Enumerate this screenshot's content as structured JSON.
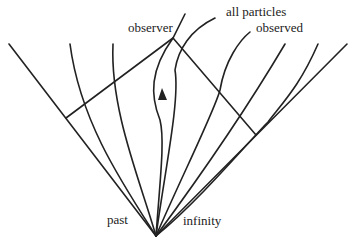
{
  "diagram": {
    "labels": {
      "observer": "observer",
      "all_particles": "all particles",
      "observed": "observed",
      "past": "past",
      "infinity": "infinity"
    },
    "colors": {
      "line": "#222222",
      "background": "#ffffff"
    },
    "geometry": {
      "past_infinity_vertex": [
        156,
        236
      ],
      "observer_point": [
        173,
        38
      ],
      "diamond_left_corner": [
        66,
        118
      ],
      "diamond_right_corner": [
        256,
        135
      ],
      "worldlines_count": 7,
      "arrow_on_observer_worldline": "upward"
    }
  }
}
